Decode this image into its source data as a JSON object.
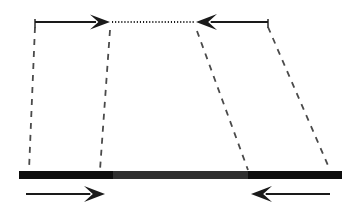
{
  "figure": {
    "canvas": {
      "width": 358,
      "height": 210,
      "background": "#ffffff"
    },
    "colors": {
      "stroke": "#1a1a1a",
      "bar_dark": "#0d0d0d",
      "bar_mid": "#2f2f2f",
      "dash": "#4a4a4a",
      "dotted": "#1a1a1a"
    },
    "upper_track": {
      "name": "upper-track",
      "y": 22,
      "left_tick_x": 35,
      "right_tick_x": 268,
      "tick_height": 7,
      "left_arrow": {
        "name": "upper-left-arrow",
        "direction": "right",
        "x1": 35,
        "x2": 110
      },
      "right_arrow": {
        "name": "upper-right-arrow",
        "direction": "left",
        "x1": 268,
        "x2": 196
      },
      "dotted_segment": {
        "name": "upper-dotted-segment",
        "x1": 112,
        "x2": 194,
        "style": "dotted"
      }
    },
    "projection_lines": [
      {
        "name": "projection-line-1",
        "x_top": 35,
        "y_top": 27,
        "x_bottom": 29,
        "y_bottom": 170
      },
      {
        "name": "projection-line-2",
        "x_top": 110,
        "y_top": 30,
        "x_bottom": 100,
        "y_bottom": 170
      },
      {
        "name": "projection-line-3",
        "x_top": 197,
        "y_top": 31,
        "x_bottom": 248,
        "y_bottom": 170
      },
      {
        "name": "projection-line-4",
        "x_top": 268,
        "y_top": 27,
        "x_bottom": 330,
        "y_bottom": 170
      }
    ],
    "bar": {
      "name": "horizontal-bar",
      "x_start": 19,
      "x_end": 342,
      "y": 171,
      "thickness": 8,
      "segments": [
        {
          "name": "bar-segment-left",
          "x_start": 19,
          "x_end": 113,
          "shade": "dark"
        },
        {
          "name": "bar-segment-middle",
          "x_start": 113,
          "x_end": 248,
          "shade": "mid"
        },
        {
          "name": "bar-segment-right",
          "x_start": 248,
          "x_end": 342,
          "shade": "dark"
        }
      ]
    },
    "lower_arrows": [
      {
        "name": "lower-left-arrow",
        "direction": "right",
        "x1": 26,
        "x2": 105,
        "y": 194
      },
      {
        "name": "lower-right-arrow",
        "direction": "left",
        "x1": 330,
        "x2": 251,
        "y": 194
      }
    ]
  }
}
